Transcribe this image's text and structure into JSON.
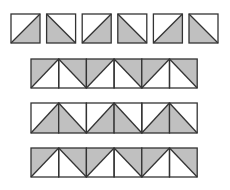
{
  "colors": {
    "fill": "#c0c0c0",
    "stroke": "#333333",
    "background": "#ffffff"
  },
  "rows": [
    {
      "name": "separate-tiles",
      "separate": true,
      "x": 11,
      "y": 14,
      "size": 29,
      "gap": 6.6,
      "tiles": [
        {
          "diagonal": "bl-tr",
          "shaded": "bottom-right"
        },
        {
          "diagonal": "tl-br",
          "shaded": "bottom-left"
        },
        {
          "diagonal": "bl-tr",
          "shaded": "bottom-right"
        },
        {
          "diagonal": "tl-br",
          "shaded": "bottom-left"
        },
        {
          "diagonal": "bl-tr",
          "shaded": "bottom-right"
        },
        {
          "diagonal": "tl-br",
          "shaded": "bottom-left"
        }
      ]
    },
    {
      "name": "joined-row-1",
      "separate": false,
      "x": 31,
      "y": 59,
      "size": 27.7,
      "height": 29,
      "gap": 0,
      "tiles": [
        {
          "diagonal": "bl-tr",
          "shaded": "top-left"
        },
        {
          "diagonal": "tl-br",
          "shaded": "top-right"
        },
        {
          "diagonal": "bl-tr",
          "shaded": "top-left"
        },
        {
          "diagonal": "tl-br",
          "shaded": "top-right"
        },
        {
          "diagonal": "bl-tr",
          "shaded": "top-left"
        },
        {
          "diagonal": "tl-br",
          "shaded": "top-right"
        }
      ]
    },
    {
      "name": "joined-row-2",
      "separate": false,
      "x": 31,
      "y": 103,
      "size": 27.7,
      "height": 30,
      "gap": 0,
      "tiles": [
        {
          "diagonal": "bl-tr",
          "shaded": "bottom-right"
        },
        {
          "diagonal": "tl-br",
          "shaded": "bottom-left"
        },
        {
          "diagonal": "bl-tr",
          "shaded": "bottom-right"
        },
        {
          "diagonal": "tl-br",
          "shaded": "bottom-left"
        },
        {
          "diagonal": "bl-tr",
          "shaded": "bottom-right"
        },
        {
          "diagonal": "tl-br",
          "shaded": "bottom-left"
        }
      ]
    },
    {
      "name": "joined-row-3",
      "separate": false,
      "x": 31,
      "y": 148,
      "size": 27.7,
      "height": 29,
      "gap": 0,
      "tiles": [
        {
          "diagonal": "bl-tr",
          "shaded": "top-left"
        },
        {
          "diagonal": "tl-br",
          "shaded": "top-right"
        },
        {
          "diagonal": "bl-tr",
          "shaded": "top-left"
        },
        {
          "diagonal": "tl-br",
          "shaded": "top-right"
        },
        {
          "diagonal": "bl-tr",
          "shaded": "top-left"
        },
        {
          "diagonal": "tl-br",
          "shaded": "top-right"
        }
      ]
    }
  ]
}
